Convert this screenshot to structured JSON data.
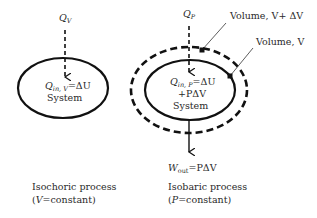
{
  "left_diagram": {
    "heat_in_label": "Q",
    "heat_in_sub": "V",
    "equation_q": "Q",
    "equation_sub": "in, V",
    "equation_rhs": "=ΔU",
    "system_label": "System",
    "caption_line1": "Isochoric process",
    "caption_open": "(",
    "caption_var": "V",
    "caption_rest": "=constant)"
  },
  "right_diagram": {
    "heat_in_label": "Q",
    "heat_in_sub": "P",
    "equation_q": "Q",
    "equation_sub": "in, P",
    "equation_rhs": "=ΔU",
    "equation_line2": "+PΔV",
    "system_label": "System",
    "volume_outer_label": "Volume, V+ ΔV",
    "volume_inner_label": "Volume, V",
    "work_w": "W",
    "work_sub": "out",
    "work_rhs": "=PΔV",
    "caption_line1": "Isobaric process",
    "caption_open": "(",
    "caption_var": "P",
    "caption_rest": "=constant)"
  },
  "colors": {
    "stroke": "#111111",
    "text": "#2a2a2a",
    "background": "#ffffff"
  }
}
